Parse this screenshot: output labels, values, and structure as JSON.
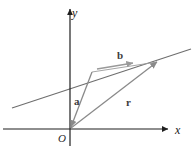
{
  "figure": {
    "background_color": "#ffffff"
  },
  "axes": {
    "x_label": "x",
    "y_label": "y",
    "origin_label": "O",
    "color": "#1f1f1f",
    "x_axis": {
      "x1": 3,
      "y1": 129,
      "x2": 168,
      "y2": 129
    },
    "y_axis": {
      "x1": 70,
      "y1": 146,
      "x2": 70,
      "y2": 9
    }
  },
  "line": {
    "name": "slanted-line",
    "color": "#6e6e6e",
    "x1": 12,
    "y1": 108,
    "x2": 191,
    "y2": 49
  },
  "vectors": [
    {
      "id": "a",
      "label": "a",
      "color": "#8a8a8a",
      "label_x": 74,
      "label_y": 105,
      "x1": 92,
      "y1": 72,
      "x2": 71,
      "y2": 127
    },
    {
      "id": "b",
      "label": "b",
      "color": "#9a9a9a",
      "label_x": 117,
      "label_y": 59,
      "x1": 97,
      "y1": 69,
      "x2": 133,
      "y2": 63
    },
    {
      "id": "r",
      "label": "r",
      "color": "#8a8a8a",
      "label_x": 126,
      "label_y": 106,
      "x1": 71,
      "y1": 128,
      "x2": 157,
      "y2": 62
    }
  ],
  "connectors": [
    {
      "id": "line-to-r-tip",
      "color": "#9a9a9a",
      "x1": 92,
      "y1": 72,
      "x2": 157,
      "y2": 62
    }
  ]
}
